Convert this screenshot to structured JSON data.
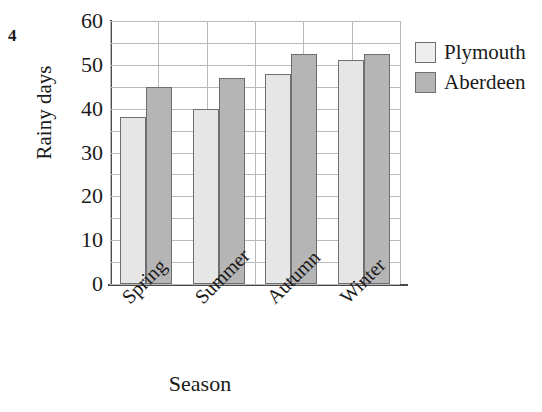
{
  "question_number": "4",
  "chart_data": {
    "type": "bar",
    "title": "",
    "xlabel": "Season",
    "ylabel": "Rainy days",
    "categories": [
      "Spring",
      "Summer",
      "Autumn",
      "Winter"
    ],
    "series": [
      {
        "name": "Plymouth",
        "values": [
          38,
          40,
          48,
          51
        ],
        "color": "#e6e6e6"
      },
      {
        "name": "Aberdeen",
        "values": [
          45,
          47,
          52.5,
          52.5
        ],
        "color": "#b5b5b5"
      }
    ],
    "ylim": [
      0,
      60
    ],
    "ytick_labels": [
      "0",
      "10",
      "20",
      "30",
      "40",
      "50",
      "60"
    ],
    "ytick_values": [
      0,
      10,
      20,
      30,
      40,
      50,
      60
    ],
    "gridline_step": 5,
    "grid": true,
    "legend_position": "right",
    "legend_entries": [
      "Plymouth",
      "Aberdeen"
    ]
  }
}
